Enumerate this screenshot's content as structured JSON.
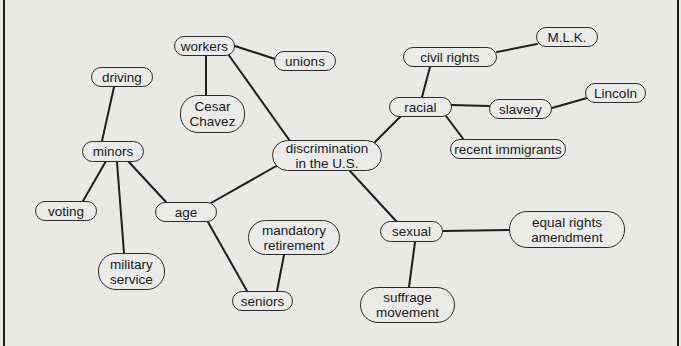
{
  "diagram": {
    "type": "concept-map",
    "center": "center",
    "colors": {
      "background": "#e9e9e7",
      "line": "#1f1f1f",
      "node_border": "#2a2a2a",
      "text": "#1a1a1a"
    },
    "nodes": {
      "center": {
        "label": "discrimination\nin the U.S.",
        "x": 272,
        "y": 140,
        "w": 110,
        "h": 31
      },
      "workers": {
        "label": "workers",
        "x": 174,
        "y": 36,
        "w": 61,
        "h": 20
      },
      "unions": {
        "label": "unions",
        "x": 274,
        "y": 51,
        "w": 62,
        "h": 20
      },
      "cesar": {
        "label": "Cesar\nChavez",
        "x": 180,
        "y": 95,
        "w": 65,
        "h": 38
      },
      "age": {
        "label": "age",
        "x": 155,
        "y": 202,
        "w": 62,
        "h": 20
      },
      "minors": {
        "label": "minors",
        "x": 82,
        "y": 141,
        "w": 62,
        "h": 21
      },
      "driving": {
        "label": "driving",
        "x": 91,
        "y": 67,
        "w": 62,
        "h": 20
      },
      "voting": {
        "label": "voting",
        "x": 35,
        "y": 201,
        "w": 62,
        "h": 20
      },
      "military": {
        "label": "military\nservice",
        "x": 98,
        "y": 253,
        "w": 67,
        "h": 37
      },
      "seniors": {
        "label": "seniors",
        "x": 232,
        "y": 291,
        "w": 61,
        "h": 20
      },
      "mandatory": {
        "label": "mandatory\nretirement",
        "x": 248,
        "y": 220,
        "w": 92,
        "h": 35
      },
      "racial": {
        "label": "racial",
        "x": 389,
        "y": 97,
        "w": 63,
        "h": 20
      },
      "civil": {
        "label": "civil rights",
        "x": 403,
        "y": 47,
        "w": 94,
        "h": 20
      },
      "mlk": {
        "label": "M.L.K.",
        "x": 536,
        "y": 27,
        "w": 62,
        "h": 20
      },
      "slavery": {
        "label": "slavery",
        "x": 489,
        "y": 99,
        "w": 63,
        "h": 20
      },
      "lincoln": {
        "label": "Lincoln",
        "x": 585,
        "y": 83,
        "w": 61,
        "h": 20
      },
      "immigrants": {
        "label": "recent immigrants",
        "x": 450,
        "y": 139,
        "w": 116,
        "h": 20
      },
      "sexual": {
        "label": "sexual",
        "x": 380,
        "y": 221,
        "w": 63,
        "h": 21
      },
      "era": {
        "label": "equal rights\namendment",
        "x": 509,
        "y": 211,
        "w": 116,
        "h": 37
      },
      "suffrage": {
        "label": "suffrage\nmovement",
        "x": 360,
        "y": 287,
        "w": 95,
        "h": 36
      }
    },
    "edges": [
      {
        "from": "center",
        "to": "workers",
        "x1": 290,
        "y1": 141,
        "x2": 228,
        "y2": 54
      },
      {
        "from": "workers",
        "to": "unions",
        "x1": 235,
        "y1": 46,
        "x2": 275,
        "y2": 59
      },
      {
        "from": "workers",
        "to": "cesar",
        "x1": 206,
        "y1": 56,
        "x2": 206,
        "y2": 95
      },
      {
        "from": "center",
        "to": "age",
        "x1": 278,
        "y1": 165,
        "x2": 211,
        "y2": 203
      },
      {
        "from": "age",
        "to": "minors",
        "x1": 166,
        "y1": 202,
        "x2": 128,
        "y2": 161
      },
      {
        "from": "minors",
        "to": "driving",
        "x1": 114,
        "y1": 87,
        "x2": 102,
        "y2": 141
      },
      {
        "from": "minors",
        "to": "voting",
        "x1": 106,
        "y1": 161,
        "x2": 83,
        "y2": 201
      },
      {
        "from": "minors",
        "to": "military",
        "x1": 117,
        "y1": 162,
        "x2": 124,
        "y2": 253
      },
      {
        "from": "age",
        "to": "seniors",
        "x1": 208,
        "y1": 222,
        "x2": 247,
        "y2": 291
      },
      {
        "from": "mandatory",
        "to": "seniors",
        "x1": 284,
        "y1": 255,
        "x2": 277,
        "y2": 291
      },
      {
        "from": "center",
        "to": "racial",
        "x1": 373,
        "y1": 144,
        "x2": 401,
        "y2": 116
      },
      {
        "from": "racial",
        "to": "civil",
        "x1": 422,
        "y1": 97,
        "x2": 430,
        "y2": 67
      },
      {
        "from": "civil",
        "to": "mlk",
        "x1": 497,
        "y1": 52,
        "x2": 537,
        "y2": 44
      },
      {
        "from": "racial",
        "to": "slavery",
        "x1": 452,
        "y1": 105,
        "x2": 489,
        "y2": 106
      },
      {
        "from": "slavery",
        "to": "lincoln",
        "x1": 552,
        "y1": 108,
        "x2": 587,
        "y2": 98
      },
      {
        "from": "racial",
        "to": "immigrants",
        "x1": 446,
        "y1": 116,
        "x2": 464,
        "y2": 140
      },
      {
        "from": "center",
        "to": "sexual",
        "x1": 350,
        "y1": 171,
        "x2": 397,
        "y2": 222
      },
      {
        "from": "sexual",
        "to": "era",
        "x1": 443,
        "y1": 231,
        "x2": 509,
        "y2": 230
      },
      {
        "from": "sexual",
        "to": "suffrage",
        "x1": 415,
        "y1": 242,
        "x2": 409,
        "y2": 287
      }
    ]
  }
}
